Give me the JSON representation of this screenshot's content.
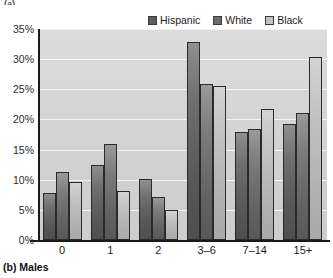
{
  "top_clipped_text": "(a)",
  "caption": "(b) Males",
  "legend": {
    "items": [
      {
        "label": "Hispanic",
        "color": "#5e5e5e"
      },
      {
        "label": "White",
        "color": "#6b6b6b"
      },
      {
        "label": "Black",
        "color": "#c2c2c2"
      }
    ]
  },
  "axis": {
    "y_ticks": [
      "0%",
      "5%",
      "10%",
      "15%",
      "20%",
      "25%",
      "30%",
      "35%"
    ],
    "x_ticks": [
      "0",
      "1",
      "2",
      "3–6",
      "7–14",
      "15+"
    ]
  },
  "chart_data": {
    "type": "bar",
    "title": "",
    "subtitle": "",
    "xlabel": "",
    "ylabel": "",
    "ylim": [
      0,
      35
    ],
    "ytick_step": 5,
    "grid": true,
    "legend_position": "top-right",
    "categories": [
      "0",
      "1",
      "2",
      "3–6",
      "7–14",
      "15+"
    ],
    "series": [
      {
        "name": "Hispanic",
        "color": "#5e5e5e",
        "values": [
          7.8,
          12.4,
          10.2,
          32.8,
          17.9,
          19.3
        ]
      },
      {
        "name": "White",
        "color": "#6b6b6b",
        "values": [
          11.2,
          16.0,
          7.1,
          25.8,
          18.4,
          21.1
        ]
      },
      {
        "name": "Black",
        "color": "#c2c2c2",
        "values": [
          9.6,
          8.2,
          5.0,
          25.6,
          21.7,
          30.3
        ]
      }
    ]
  }
}
